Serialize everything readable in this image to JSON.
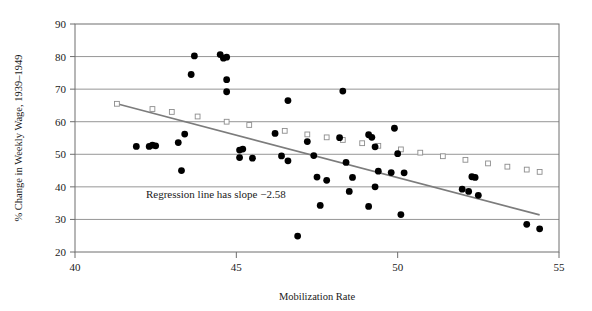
{
  "chart_data": {
    "type": "scatter",
    "title": "",
    "xlabel": "Mobilization Rate",
    "ylabel": "% Change in Weekly Wage, 1939–1949",
    "xlim": [
      40,
      55
    ],
    "ylim": [
      20,
      90
    ],
    "xticks": [
      40,
      45,
      50,
      55
    ],
    "yticks": [
      20,
      30,
      40,
      50,
      60,
      70,
      80,
      90
    ],
    "xtick_labels": [
      "40",
      "45",
      "50",
      "55"
    ],
    "ytick_labels": [
      "20",
      "30",
      "40",
      "50",
      "60",
      "70",
      "80",
      "90"
    ],
    "grid": "horizontal",
    "legend": "none",
    "annotations": [
      {
        "text": "Regression line has slope −2.58",
        "x": 42.2,
        "y": 36.5
      }
    ],
    "series": [
      {
        "name": "Observations",
        "type": "scatter",
        "marker": "filled-circle",
        "color": "#000000",
        "points": [
          [
            41.9,
            52.4
          ],
          [
            42.3,
            52.4
          ],
          [
            42.4,
            52.8
          ],
          [
            42.5,
            52.6
          ],
          [
            43.2,
            53.6
          ],
          [
            43.4,
            56.2
          ],
          [
            43.7,
            80.2
          ],
          [
            43.6,
            74.5
          ],
          [
            44.5,
            80.6
          ],
          [
            44.7,
            79.8
          ],
          [
            44.6,
            79.5
          ],
          [
            44.7,
            72.9
          ],
          [
            44.7,
            69.2
          ],
          [
            43.3,
            45.0
          ],
          [
            45.1,
            51.3
          ],
          [
            45.2,
            51.6
          ],
          [
            45.1,
            49.0
          ],
          [
            45.5,
            48.8
          ],
          [
            46.2,
            56.4
          ],
          [
            46.4,
            49.5
          ],
          [
            46.6,
            66.5
          ],
          [
            46.6,
            48.0
          ],
          [
            46.9,
            24.9
          ],
          [
            47.2,
            53.9
          ],
          [
            47.4,
            49.6
          ],
          [
            47.5,
            43.0
          ],
          [
            47.8,
            42.0
          ],
          [
            47.6,
            34.3
          ],
          [
            48.2,
            55.1
          ],
          [
            48.4,
            47.5
          ],
          [
            48.3,
            69.4
          ],
          [
            48.6,
            42.9
          ],
          [
            48.5,
            38.6
          ],
          [
            49.1,
            56.0
          ],
          [
            49.2,
            55.2
          ],
          [
            49.3,
            52.3
          ],
          [
            49.4,
            44.8
          ],
          [
            49.3,
            40.0
          ],
          [
            49.1,
            34.0
          ],
          [
            49.9,
            58.0
          ],
          [
            50.0,
            50.2
          ],
          [
            49.8,
            44.4
          ],
          [
            50.2,
            44.3
          ],
          [
            50.1,
            31.5
          ],
          [
            52.3,
            43.1
          ],
          [
            52.4,
            42.9
          ],
          [
            52.0,
            39.3
          ],
          [
            52.2,
            38.6
          ],
          [
            52.5,
            37.4
          ],
          [
            54.0,
            28.5
          ],
          [
            54.4,
            27.1
          ]
        ]
      },
      {
        "name": "Regression line",
        "type": "line",
        "marker": "open-square",
        "color": "#7c7c7c",
        "slope": -2.58,
        "endpoints": [
          [
            41.3,
            65.5
          ],
          [
            54.4,
            31.4
          ]
        ],
        "marker_points": [
          [
            41.3,
            65.5
          ],
          [
            42.4,
            63.9
          ],
          [
            43.0,
            63.0
          ],
          [
            43.8,
            61.6
          ],
          [
            44.7,
            60.0
          ],
          [
            45.4,
            59.0
          ],
          [
            46.5,
            57.2
          ],
          [
            47.2,
            56.1
          ],
          [
            47.8,
            55.2
          ],
          [
            48.3,
            54.4
          ],
          [
            48.9,
            53.4
          ],
          [
            49.4,
            52.6
          ],
          [
            50.1,
            51.5
          ],
          [
            50.7,
            50.5
          ],
          [
            51.4,
            49.4
          ],
          [
            52.1,
            48.3
          ],
          [
            52.8,
            47.2
          ],
          [
            53.4,
            46.2
          ],
          [
            54.0,
            45.3
          ],
          [
            54.4,
            44.6
          ]
        ]
      }
    ]
  }
}
